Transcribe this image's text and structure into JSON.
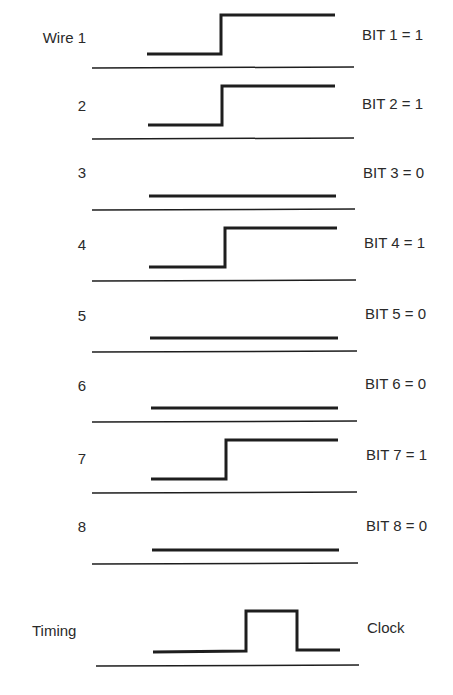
{
  "colors": {
    "line": "#1e1e1e",
    "text": "#2a2a2a",
    "background": "#ffffff"
  },
  "wires": [
    {
      "label": "Wire 1",
      "bit_label": "BIT 1 = 1",
      "bit": 1
    },
    {
      "label": "2",
      "bit_label": "BIT 2 = 1",
      "bit": 1
    },
    {
      "label": "3",
      "bit_label": "BIT 3 = 0",
      "bit": 0
    },
    {
      "label": "4",
      "bit_label": "BIT 4 = 1",
      "bit": 1
    },
    {
      "label": "5",
      "bit_label": "BIT 5 = 0",
      "bit": 0
    },
    {
      "label": "6",
      "bit_label": "BIT 6 = 0",
      "bit": 0
    },
    {
      "label": "7",
      "bit_label": "BIT 7 = 1",
      "bit": 1
    },
    {
      "label": "8",
      "bit_label": "BIT 8 = 0",
      "bit": 0
    }
  ],
  "timing": {
    "label": "Timing",
    "signal_label": "Clock"
  }
}
